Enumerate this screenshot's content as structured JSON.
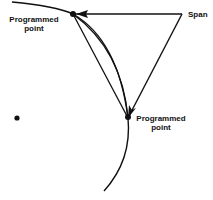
{
  "diagram": {
    "labels": {
      "top_point": [
        "Programmed",
        "point"
      ],
      "bottom_point": [
        "Programmed",
        "point"
      ],
      "span": "Span"
    },
    "colors": {
      "ink": "#111111",
      "background": "#ffffff"
    }
  }
}
